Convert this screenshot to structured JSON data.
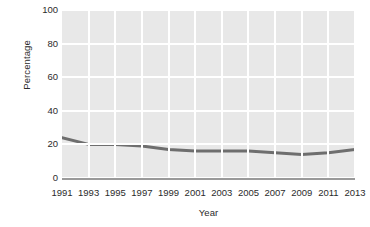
{
  "chart_data": {
    "type": "line",
    "title": "",
    "subtitle": "",
    "xlabel": "Year",
    "ylabel": "Percentage",
    "x": [
      1991,
      1993,
      1995,
      1997,
      1999,
      2001,
      2003,
      2005,
      2007,
      2009,
      2011,
      2013
    ],
    "xtick_labels": [
      "1991",
      "1993",
      "1995",
      "1997",
      "1999",
      "2001",
      "2003",
      "2005",
      "2007",
      "2009",
      "2011",
      "2013"
    ],
    "ytick_labels": [
      "0",
      "20",
      "40",
      "60",
      "80",
      "100"
    ],
    "yticks": [
      0,
      20,
      40,
      60,
      80,
      100
    ],
    "ylim": [
      0,
      100
    ],
    "xlim": [
      1991,
      2013
    ],
    "grid": true,
    "grid_color": "#ffffff",
    "plot_background": "#e8e8e8",
    "legend": null,
    "legend_position": "none",
    "series": [
      {
        "name": "Percentage",
        "color": "#6e6e6e",
        "line_width": 3,
        "values": [
          24,
          20,
          20,
          19,
          17,
          16,
          16,
          16,
          15,
          14,
          15,
          17
        ]
      }
    ],
    "annotations": []
  }
}
